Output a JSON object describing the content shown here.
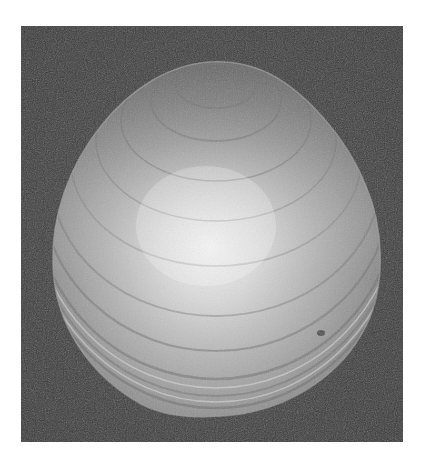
{
  "image": {
    "subject": "bivalve shell (clam/oyster valve) photographed from above",
    "style": "grayscale photograph",
    "colors": {
      "page_background": "#ffffff",
      "photo_background": "#3a3a3a",
      "shell_highlight": "#f2f2f2",
      "shell_midtone": "#a9a9a9",
      "shell_edge": "#7a7a7a",
      "growth_ring": "#6e6e6e"
    },
    "frame": {
      "x": 21,
      "y": 26,
      "width": 382,
      "height": 416
    }
  }
}
